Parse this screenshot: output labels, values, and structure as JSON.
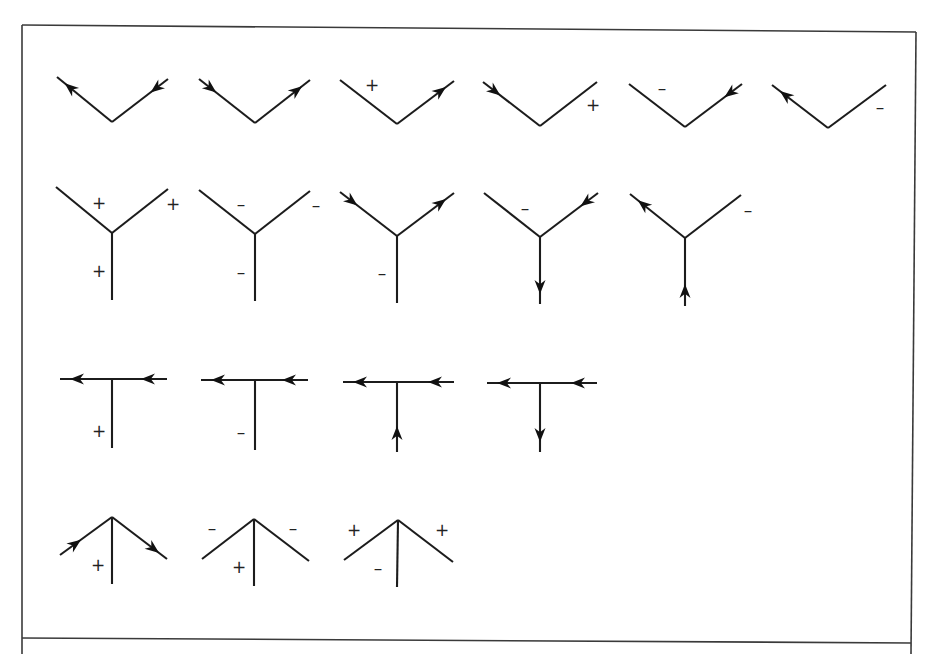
{
  "figure": {
    "colors": {
      "ink": "#1c1c1c",
      "frame": "#3a3a3a",
      "background": "#ffffff"
    },
    "frame": {
      "top": [
        [
          22,
          25
        ],
        [
          916,
          32
        ]
      ],
      "right": [
        [
          916,
          32
        ],
        [
          911,
          654
        ]
      ],
      "bottom": [
        [
          22,
          638
        ],
        [
          911,
          643
        ]
      ],
      "left": [
        [
          22,
          25
        ],
        [
          22,
          654
        ]
      ]
    },
    "rows": [
      {
        "name": "L-junctions",
        "junctions": [
          {
            "edges": [
              {
                "from": [
                  112,
                  122
                ],
                "to": [
                  57,
                  77
                ],
                "arrow": "out"
              },
              {
                "from": [
                  112,
                  122
                ],
                "to": [
                  168,
                  79
                ],
                "arrow": "in"
              }
            ],
            "labels": []
          },
          {
            "edges": [
              {
                "from": [
                  255,
                  123
                ],
                "to": [
                  199,
                  79
                ],
                "arrow": "in"
              },
              {
                "from": [
                  255,
                  123
                ],
                "to": [
                  310,
                  80
                ],
                "arrow": "out"
              }
            ],
            "labels": []
          },
          {
            "edges": [
              {
                "from": [
                  397,
                  124
                ],
                "to": [
                  340,
                  80
                ],
                "arrow": "none"
              },
              {
                "from": [
                  397,
                  124
                ],
                "to": [
                  454,
                  81
                ],
                "arrow": "out"
              }
            ],
            "labels": [
              {
                "text": "+",
                "x": 372,
                "y": 85
              }
            ]
          },
          {
            "edges": [
              {
                "from": [
                  540,
                  126
                ],
                "to": [
                  483,
                  82
                ],
                "arrow": "in"
              },
              {
                "from": [
                  540,
                  126
                ],
                "to": [
                  597,
                  82
                ],
                "arrow": "none"
              }
            ],
            "labels": [
              {
                "text": "+",
                "x": 593,
                "y": 105
              }
            ]
          },
          {
            "edges": [
              {
                "from": [
                  685,
                  127
                ],
                "to": [
                  629,
                  84
                ],
                "arrow": "none"
              },
              {
                "from": [
                  685,
                  127
                ],
                "to": [
                  742,
                  84
                ],
                "arrow": "in"
              }
            ],
            "labels": [
              {
                "text": "–",
                "x": 662,
                "y": 88
              }
            ]
          },
          {
            "edges": [
              {
                "from": [
                  828,
                  128
                ],
                "to": [
                  772,
                  85
                ],
                "arrow": "out"
              },
              {
                "from": [
                  828,
                  128
                ],
                "to": [
                  886,
                  85
                ],
                "arrow": "none"
              }
            ],
            "labels": [
              {
                "text": "–",
                "x": 880,
                "y": 107
              }
            ]
          }
        ]
      },
      {
        "name": "Fork (Y) junctions",
        "junctions": [
          {
            "edges": [
              {
                "from": [
                  112,
                  233
                ],
                "to": [
                  56,
                  187
                ],
                "arrow": "none"
              },
              {
                "from": [
                  112,
                  233
                ],
                "to": [
                  168,
                  189
                ],
                "arrow": "none"
              },
              {
                "from": [
                  112,
                  233
                ],
                "to": [
                  112,
                  300
                ],
                "arrow": "none"
              }
            ],
            "labels": [
              {
                "text": "+",
                "x": 99,
                "y": 203
              },
              {
                "text": "+",
                "x": 173,
                "y": 204
              },
              {
                "text": "+",
                "x": 99,
                "y": 271
              }
            ]
          },
          {
            "edges": [
              {
                "from": [
                  255,
                  234
                ],
                "to": [
                  199,
                  190
                ],
                "arrow": "none"
              },
              {
                "from": [
                  255,
                  234
                ],
                "to": [
                  310,
                  191
                ],
                "arrow": "none"
              },
              {
                "from": [
                  255,
                  234
                ],
                "to": [
                  255,
                  301
                ],
                "arrow": "none"
              }
            ],
            "labels": [
              {
                "text": "–",
                "x": 241,
                "y": 204
              },
              {
                "text": "–",
                "x": 316,
                "y": 205
              },
              {
                "text": "–",
                "x": 241,
                "y": 272
              }
            ]
          },
          {
            "edges": [
              {
                "from": [
                  397,
                  236
                ],
                "to": [
                  340,
                  192
                ],
                "arrow": "in"
              },
              {
                "from": [
                  397,
                  236
                ],
                "to": [
                  454,
                  193
                ],
                "arrow": "out"
              },
              {
                "from": [
                  397,
                  236
                ],
                "to": [
                  397,
                  303
                ],
                "arrow": "none"
              }
            ],
            "labels": [
              {
                "text": "–",
                "x": 382,
                "y": 273
              }
            ]
          },
          {
            "edges": [
              {
                "from": [
                  540,
                  237
                ],
                "to": [
                  484,
                  193
                ],
                "arrow": "none"
              },
              {
                "from": [
                  540,
                  237
                ],
                "to": [
                  598,
                  193
                ],
                "arrow": "in"
              },
              {
                "from": [
                  540,
                  237
                ],
                "to": [
                  540,
                  304
                ],
                "arrow": "out"
              }
            ],
            "labels": [
              {
                "text": "–",
                "x": 525,
                "y": 208
              }
            ]
          },
          {
            "edges": [
              {
                "from": [
                  685,
                  238
                ],
                "to": [
                  630,
                  194
                ],
                "arrow": "out"
              },
              {
                "from": [
                  685,
                  238
                ],
                "to": [
                  741,
                  195
                ],
                "arrow": "none"
              },
              {
                "from": [
                  685,
                  238
                ],
                "to": [
                  685,
                  306
                ],
                "arrow": "in"
              }
            ],
            "labels": [
              {
                "text": "–",
                "x": 748,
                "y": 210
              }
            ]
          }
        ]
      },
      {
        "name": "T-junctions",
        "junctions": [
          {
            "edges": [
              {
                "from": [
                  112,
                  379
                ],
                "to": [
                  60,
                  379
                ],
                "arrow": "out"
              },
              {
                "from": [
                  167,
                  379
                ],
                "to": [
                  112,
                  379
                ],
                "arrow": "in_at_start"
              },
              {
                "from": [
                  112,
                  379
                ],
                "to": [
                  112,
                  448
                ],
                "arrow": "none"
              }
            ],
            "labels": [
              {
                "text": "+",
                "x": 99,
                "y": 431
              }
            ]
          },
          {
            "edges": [
              {
                "from": [
                  255,
                  380
                ],
                "to": [
                  201,
                  380
                ],
                "arrow": "out"
              },
              {
                "from": [
                  308,
                  380
                ],
                "to": [
                  255,
                  380
                ],
                "arrow": "in_at_start"
              },
              {
                "from": [
                  255,
                  380
                ],
                "to": [
                  255,
                  450
                ],
                "arrow": "none"
              }
            ],
            "labels": [
              {
                "text": "–",
                "x": 241,
                "y": 432
              }
            ]
          },
          {
            "edges": [
              {
                "from": [
                  397,
                  382
                ],
                "to": [
                  343,
                  382
                ],
                "arrow": "out"
              },
              {
                "from": [
                  454,
                  382
                ],
                "to": [
                  397,
                  382
                ],
                "arrow": "in_at_start"
              },
              {
                "from": [
                  397,
                  452
                ],
                "to": [
                  397,
                  382
                ],
                "arrow": "in_at_start"
              }
            ],
            "labels": []
          },
          {
            "edges": [
              {
                "from": [
                  540,
                  383
                ],
                "to": [
                  487,
                  383
                ],
                "arrow": "out"
              },
              {
                "from": [
                  597,
                  383
                ],
                "to": [
                  540,
                  383
                ],
                "arrow": "in_at_start"
              },
              {
                "from": [
                  540,
                  383
                ],
                "to": [
                  540,
                  452
                ],
                "arrow": "out"
              }
            ],
            "labels": []
          }
        ]
      },
      {
        "name": "Arrow junctions",
        "junctions": [
          {
            "edges": [
              {
                "from": [
                  60,
                  555
                ],
                "to": [
                  112,
                  517
                ],
                "arrow": "in_at_start"
              },
              {
                "from": [
                  112,
                  517
                ],
                "to": [
                  167,
                  559
                ],
                "arrow": "out"
              },
              {
                "from": [
                  112,
                  517
                ],
                "to": [
                  112,
                  584
                ],
                "arrow": "none"
              }
            ],
            "labels": [
              {
                "text": "+",
                "x": 98,
                "y": 565
              }
            ]
          },
          {
            "edges": [
              {
                "from": [
                  254,
                  519
                ],
                "to": [
                  202,
                  559
                ],
                "arrow": "none"
              },
              {
                "from": [
                  254,
                  519
                ],
                "to": [
                  309,
                  561
                ],
                "arrow": "none"
              },
              {
                "from": [
                  254,
                  519
                ],
                "to": [
                  254,
                  586
                ],
                "arrow": "none"
              }
            ],
            "labels": [
              {
                "text": "–",
                "x": 212,
                "y": 528
              },
              {
                "text": "–",
                "x": 293,
                "y": 528
              },
              {
                "text": "+",
                "x": 239,
                "y": 567
              }
            ]
          },
          {
            "edges": [
              {
                "from": [
                  398,
                  520
                ],
                "to": [
                  344,
                  560
                ],
                "arrow": "none"
              },
              {
                "from": [
                  398,
                  520
                ],
                "to": [
                  453,
                  562
                ],
                "arrow": "none"
              },
              {
                "from": [
                  398,
                  520
                ],
                "to": [
                  397,
                  587
                ],
                "arrow": "none"
              }
            ],
            "labels": [
              {
                "text": "+",
                "x": 354,
                "y": 530
              },
              {
                "text": "+",
                "x": 442,
                "y": 530
              },
              {
                "text": "–",
                "x": 378,
                "y": 568
              }
            ]
          }
        ]
      }
    ]
  }
}
